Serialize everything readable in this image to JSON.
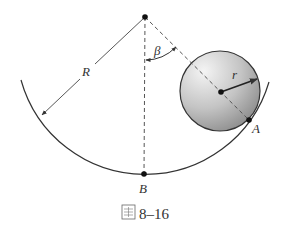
{
  "figure": {
    "caption_prefix": "圖",
    "caption_number": "8–16",
    "labels": {
      "big_radius": "R",
      "small_radius": "r",
      "angle": "β",
      "point_contact": "A",
      "point_bottom": "B"
    },
    "colors": {
      "stroke": "#333333",
      "dash": "#555555",
      "sphere_light": "#f2f2f2",
      "sphere_dark": "#8e8e8e"
    }
  }
}
